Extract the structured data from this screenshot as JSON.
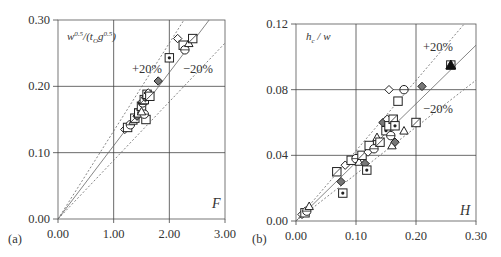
{
  "chart_data": [
    {
      "type": "scatter",
      "panel_label": "(a)",
      "title": "",
      "xlabel": "F",
      "ylabel": "w^0.5/(t_O g^0.5)",
      "xlim": [
        0,
        3
      ],
      "ylim": [
        0,
        0.3
      ],
      "xticks": [
        "0.00",
        "1.00",
        "2.00",
        "3.00"
      ],
      "yticks": [
        "0.00",
        "0.10",
        "0.20",
        "0.30"
      ],
      "grid": true,
      "reference_lines": [
        {
          "name": "1:1 fit",
          "style": "solid",
          "slope": 0.1105
        },
        {
          "name": "+20%",
          "style": "dotted",
          "slope": 0.1326
        },
        {
          "name": "-20%",
          "style": "dotted",
          "slope": 0.0884
        }
      ],
      "annotations": [
        "+20%",
        "-20%"
      ],
      "points": [
        {
          "x": 1.2,
          "y": 0.135
        },
        {
          "x": 1.25,
          "y": 0.138
        },
        {
          "x": 1.3,
          "y": 0.142
        },
        {
          "x": 1.35,
          "y": 0.148
        },
        {
          "x": 1.38,
          "y": 0.152
        },
        {
          "x": 1.42,
          "y": 0.155
        },
        {
          "x": 1.45,
          "y": 0.16
        },
        {
          "x": 1.48,
          "y": 0.165
        },
        {
          "x": 1.5,
          "y": 0.17
        },
        {
          "x": 1.52,
          "y": 0.175
        },
        {
          "x": 1.53,
          "y": 0.178
        },
        {
          "x": 1.55,
          "y": 0.18
        },
        {
          "x": 1.57,
          "y": 0.183
        },
        {
          "x": 1.6,
          "y": 0.188
        },
        {
          "x": 1.62,
          "y": 0.19
        },
        {
          "x": 1.58,
          "y": 0.15
        },
        {
          "x": 1.55,
          "y": 0.158
        },
        {
          "x": 1.5,
          "y": 0.162
        },
        {
          "x": 1.65,
          "y": 0.185
        },
        {
          "x": 1.8,
          "y": 0.208
        },
        {
          "x": 2.0,
          "y": 0.243
        },
        {
          "x": 2.15,
          "y": 0.272
        },
        {
          "x": 2.25,
          "y": 0.262
        },
        {
          "x": 2.28,
          "y": 0.255
        },
        {
          "x": 2.35,
          "y": 0.265
        },
        {
          "x": 2.42,
          "y": 0.272
        }
      ]
    },
    {
      "type": "scatter",
      "panel_label": "(b)",
      "title": "",
      "xlabel": "H",
      "ylabel": "h_c / w",
      "xlim": [
        0,
        0.3
      ],
      "ylim": [
        0,
        0.12
      ],
      "xticks": [
        "0.00",
        "0.10",
        "0.20",
        "0.30"
      ],
      "yticks": [
        "0.00",
        "0.04",
        "0.08",
        "0.12"
      ],
      "grid": true,
      "reference_lines": [
        {
          "name": "1:1 fit",
          "style": "solid",
          "slope": 0.357
        },
        {
          "name": "+20%",
          "style": "dotted",
          "slope": 0.428
        },
        {
          "name": "-20%",
          "style": "dotted",
          "slope": 0.286
        }
      ],
      "annotations": [
        "+20%",
        "-20%"
      ],
      "points": [
        {
          "x": 0.01,
          "y": 0.004
        },
        {
          "x": 0.015,
          "y": 0.005
        },
        {
          "x": 0.018,
          "y": 0.006
        },
        {
          "x": 0.022,
          "y": 0.009
        },
        {
          "x": 0.068,
          "y": 0.03
        },
        {
          "x": 0.075,
          "y": 0.024
        },
        {
          "x": 0.078,
          "y": 0.017
        },
        {
          "x": 0.082,
          "y": 0.034
        },
        {
          "x": 0.092,
          "y": 0.037
        },
        {
          "x": 0.1,
          "y": 0.038
        },
        {
          "x": 0.105,
          "y": 0.036
        },
        {
          "x": 0.11,
          "y": 0.04
        },
        {
          "x": 0.115,
          "y": 0.035
        },
        {
          "x": 0.118,
          "y": 0.031
        },
        {
          "x": 0.12,
          "y": 0.042
        },
        {
          "x": 0.122,
          "y": 0.046
        },
        {
          "x": 0.13,
          "y": 0.044
        },
        {
          "x": 0.135,
          "y": 0.051
        },
        {
          "x": 0.14,
          "y": 0.048
        },
        {
          "x": 0.145,
          "y": 0.06
        },
        {
          "x": 0.15,
          "y": 0.055
        },
        {
          "x": 0.152,
          "y": 0.062
        },
        {
          "x": 0.155,
          "y": 0.058
        },
        {
          "x": 0.158,
          "y": 0.052
        },
        {
          "x": 0.16,
          "y": 0.046
        },
        {
          "x": 0.162,
          "y": 0.062
        },
        {
          "x": 0.165,
          "y": 0.048
        },
        {
          "x": 0.165,
          "y": 0.058
        },
        {
          "x": 0.155,
          "y": 0.08
        },
        {
          "x": 0.17,
          "y": 0.073
        },
        {
          "x": 0.18,
          "y": 0.08
        },
        {
          "x": 0.18,
          "y": 0.055
        },
        {
          "x": 0.2,
          "y": 0.06
        },
        {
          "x": 0.21,
          "y": 0.082
        },
        {
          "x": 0.258,
          "y": 0.095
        }
      ]
    }
  ]
}
